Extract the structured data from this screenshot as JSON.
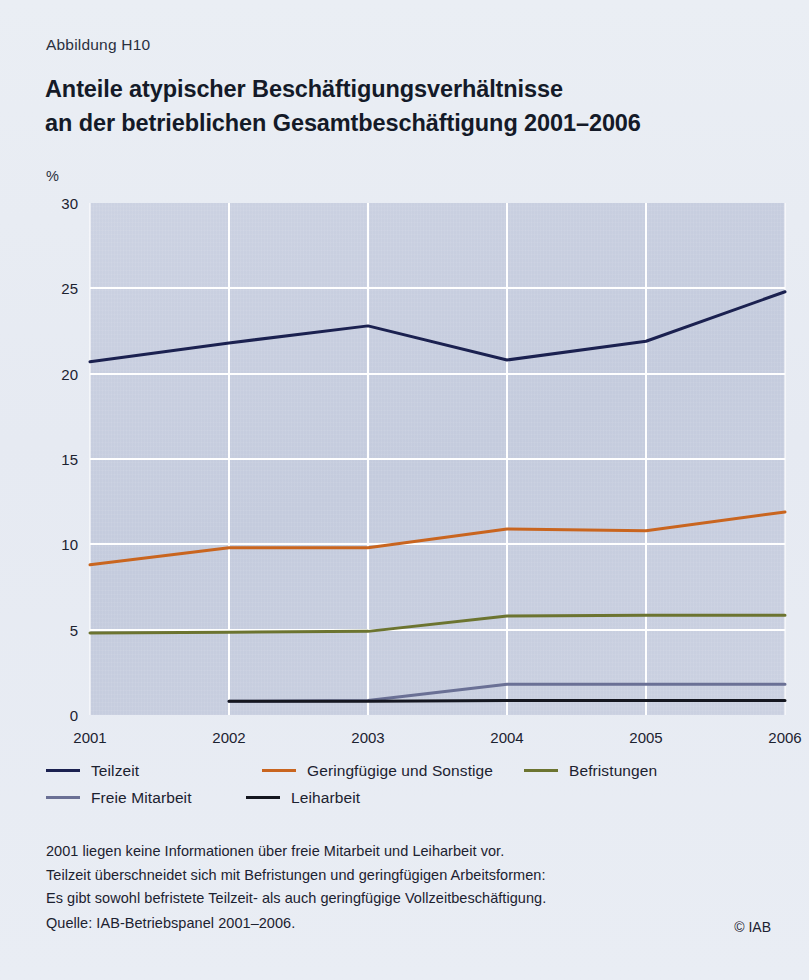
{
  "figure_number": "Abbildung H10",
  "title": {
    "line1": "Anteile atypischer Beschäftigungsverhältnisse",
    "line2": "an der betrieblichen Gesamtbeschäftigung 2001–2006"
  },
  "axis_unit": "%",
  "legend": {
    "row1": [
      {
        "label": "Teilzeit",
        "color": "#1b2150"
      },
      {
        "label": "Geringfügige und Sonstige",
        "color": "#c9651f"
      },
      {
        "label": "Befristungen",
        "color": "#6c7430"
      }
    ],
    "row2": [
      {
        "label": "Freie Mitarbeit",
        "color": "#6a7095"
      },
      {
        "label": "Leiharbeit",
        "color": "#14161f"
      }
    ]
  },
  "notes": [
    "2001 liegen keine Informationen über freie Mitarbeit und Leiharbeit vor.",
    "Teilzeit überschneidet sich mit Befristungen und geringfügigen Arbeitsformen:",
    "Es gibt sowohl befristete Teilzeit- als auch geringfügige Vollzeitbeschäftigung."
  ],
  "source": "Quelle: IAB-Betriebspanel 2001–2006.",
  "copyright": "© IAB",
  "chart_data": {
    "type": "line",
    "title": "Anteile atypischer Beschäftigungsverhältnisse an der betrieblichen Gesamtbeschäftigung 2001–2006",
    "xlabel": "",
    "ylabel": "%",
    "x": [
      "2001",
      "2002",
      "2003",
      "2004",
      "2005",
      "2006"
    ],
    "ylim": [
      0,
      30
    ],
    "yticks": [
      "0",
      "5",
      "10",
      "15",
      "20",
      "25",
      "30"
    ],
    "grid": true,
    "legend_position": "below",
    "series": [
      {
        "name": "Teilzeit",
        "color": "#1b2150",
        "values": [
          20.7,
          21.8,
          22.8,
          20.8,
          21.9,
          24.8
        ]
      },
      {
        "name": "Geringfügige und Sonstige",
        "color": "#c9651f",
        "values": [
          8.8,
          9.8,
          9.8,
          10.9,
          10.8,
          11.9
        ]
      },
      {
        "name": "Befristungen",
        "color": "#6c7430",
        "values": [
          4.8,
          4.85,
          4.9,
          5.8,
          5.85,
          5.85
        ]
      },
      {
        "name": "Freie Mitarbeit",
        "color": "#6a7095",
        "values": [
          null,
          0.8,
          0.85,
          1.8,
          1.8,
          1.8
        ]
      },
      {
        "name": "Leiharbeit",
        "color": "#14161f",
        "values": [
          null,
          0.8,
          0.8,
          0.85,
          0.85,
          0.85
        ]
      }
    ]
  }
}
